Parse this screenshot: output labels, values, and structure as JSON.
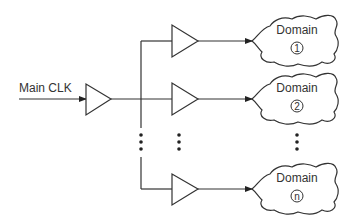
{
  "diagram": {
    "source": {
      "label": "Main CLK"
    },
    "domains": [
      {
        "label": "Domain",
        "index": "1"
      },
      {
        "label": "Domain",
        "index": "2"
      },
      {
        "label": "Domain",
        "index": "n"
      }
    ],
    "ellipsis": "⋮",
    "colors": {
      "stroke": "#333333",
      "background": "#ffffff"
    }
  }
}
